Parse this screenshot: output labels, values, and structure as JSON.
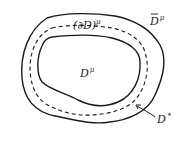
{
  "diagram": {
    "type": "nested-regions",
    "labels": {
      "inner_region": {
        "base": "D",
        "sup": "μ"
      },
      "boundary": {
        "base": "(∂D)",
        "sup": "μ"
      },
      "closure": {
        "base": "D",
        "overline": true,
        "sup": "μ"
      },
      "annulus": {
        "base": "D",
        "sup": "*"
      }
    },
    "curves": [
      {
        "name": "outer-boundary",
        "style": "solid"
      },
      {
        "name": "dashed-boundary",
        "style": "dashed"
      },
      {
        "name": "inner-boundary",
        "style": "solid"
      }
    ],
    "arrow": {
      "from": "annulus-label",
      "to": "dashed-boundary"
    }
  }
}
